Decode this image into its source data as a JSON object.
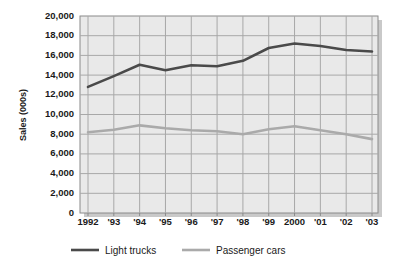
{
  "chart_data": {
    "type": "line",
    "title": "",
    "xlabel": "",
    "ylabel": "Sales (000s)",
    "x": [
      "1992",
      "1993",
      "1994",
      "1995",
      "1996",
      "1997",
      "1998",
      "1999",
      "2000",
      "2001",
      "2002",
      "2003"
    ],
    "xtick_labels": [
      "1992",
      "'93",
      "'94",
      "'95",
      "'96",
      "'97",
      "'98",
      "'99",
      "2000",
      "'01",
      "'02",
      "'03"
    ],
    "ytick_labels": [
      "20,000",
      "18,000",
      "16,000",
      "14,000",
      "12,000",
      "10,000",
      "8,000",
      "6,000",
      "4,000",
      "2,000",
      "0"
    ],
    "ytick_values": [
      20000,
      18000,
      16000,
      14000,
      12000,
      10000,
      8000,
      6000,
      4000,
      2000,
      0
    ],
    "ylim": [
      0,
      20000
    ],
    "grid": true,
    "legend_position": "bottom",
    "series": [
      {
        "name": "Light trucks",
        "color": "#4a4a4a",
        "values": [
          12800,
          13900,
          15050,
          14500,
          15000,
          14900,
          15450,
          16750,
          17200,
          16950,
          16550,
          16400
        ]
      },
      {
        "name": "Passenger cars",
        "color": "#aaaaaa",
        "values": [
          8200,
          8450,
          8900,
          8600,
          8400,
          8300,
          8000,
          8500,
          8800,
          8400,
          8000,
          7500
        ]
      }
    ]
  },
  "colors": {
    "plot_background": "#e9e9e9",
    "gridline": "#a8a8a8",
    "frame": "#8a8a8a",
    "shadow": "#c9c9c9",
    "text": "#1a1a1a"
  },
  "legend": {
    "items": [
      {
        "label": "Light trucks",
        "color": "#4a4a4a"
      },
      {
        "label": "Passenger cars",
        "color": "#aaaaaa"
      }
    ]
  }
}
